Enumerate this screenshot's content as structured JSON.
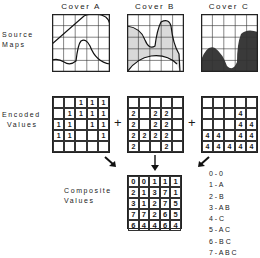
{
  "covers": [
    {
      "title": "Cover A"
    },
    {
      "title": "Cover B"
    },
    {
      "title": "Cover C"
    }
  ],
  "row_labels": {
    "source": [
      "Source",
      "Maps"
    ],
    "encoded": [
      "Encoded",
      "Values"
    ],
    "composite": [
      "Composite",
      "Values"
    ]
  },
  "operators": {
    "plus1": "+",
    "plus2": "+"
  },
  "encoded": {
    "A": [
      [
        "",
        "",
        "1",
        "1",
        "1"
      ],
      [
        "",
        "1",
        "1",
        "1",
        "1"
      ],
      [
        "1",
        "1",
        "",
        "1",
        "1"
      ],
      [
        "1",
        "1",
        "",
        "",
        "1"
      ],
      [
        "",
        "",
        "",
        "",
        ""
      ]
    ],
    "B": [
      [
        "",
        "",
        "",
        "",
        ""
      ],
      [
        "2",
        "",
        "2",
        "2",
        ""
      ],
      [
        "2",
        "",
        "2",
        "2",
        ""
      ],
      [
        "2",
        "2",
        "2",
        "2",
        ""
      ],
      [
        "2",
        "",
        "",
        "2",
        ""
      ]
    ],
    "C": [
      [
        "",
        "",
        "",
        "",
        ""
      ],
      [
        "",
        "",
        "",
        "4",
        ""
      ],
      [
        "",
        "",
        "",
        "4",
        "4"
      ],
      [
        "4",
        "4",
        "",
        "4",
        "4"
      ],
      [
        "4",
        "4",
        "4",
        "4",
        "4"
      ]
    ]
  },
  "composite": [
    [
      "0",
      "0",
      "1",
      "1",
      "1"
    ],
    [
      "2",
      "1",
      "3",
      "7",
      "1"
    ],
    [
      "3",
      "1",
      "2",
      "7",
      "5"
    ],
    [
      "7",
      "7",
      "2",
      "6",
      "5"
    ],
    [
      "6",
      "4",
      "4",
      "6",
      "4"
    ]
  ],
  "legend": [
    "0 - 0",
    "1 - A",
    "2 - B",
    "3 - A B",
    "4 - C",
    "5 - A C",
    "6 - B C",
    "7 - A B C"
  ],
  "colors": {
    "coverB_fill": "#d9d9d9",
    "coverC_fill": "#3a3a3a",
    "line": "#222222"
  }
}
